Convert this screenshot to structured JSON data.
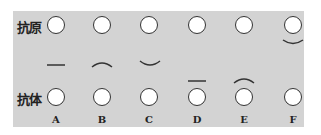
{
  "row_labels": {
    "antigen": "抗原",
    "antibody": "抗体"
  },
  "columns": [
    {
      "label": "A",
      "antigen_mark": "none",
      "middle_mark": "flat-line",
      "antibody_mark": "none"
    },
    {
      "label": "B",
      "antigen_mark": "none",
      "middle_mark": "arc-up",
      "antibody_mark": "none"
    },
    {
      "label": "C",
      "antigen_mark": "none",
      "middle_mark": "arc-down",
      "antibody_mark": "none"
    },
    {
      "label": "D",
      "antigen_mark": "none",
      "middle_mark": "none",
      "antibody_mark": "flat-line-above"
    },
    {
      "label": "E",
      "antigen_mark": "none",
      "middle_mark": "none",
      "antibody_mark": "arc-up-above"
    },
    {
      "label": "F",
      "antigen_mark": "arc-down-below",
      "middle_mark": "none",
      "antibody_mark": "none"
    }
  ],
  "colors": {
    "panel": "#d3d3d3",
    "stroke": "#333333",
    "circle_fill": "#ffffff"
  }
}
